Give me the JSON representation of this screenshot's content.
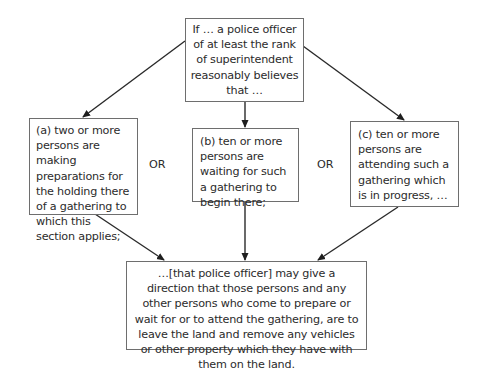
{
  "diagram": {
    "type": "flowchart",
    "condition": {
      "text": "If … a police officer of at least the rank of superintendent reasonably believes that …"
    },
    "options": [
      {
        "id": "a",
        "text": "(a) two or more persons are making preparations for the holding there of a gathering to which this section applies;"
      },
      {
        "id": "b",
        "text": "(b) ten or more persons are waiting for such a gathering to begin there;"
      },
      {
        "id": "c",
        "text": "(c) ten or more persons are attending such a gathering which is in progress, …"
      }
    ],
    "connectors": [
      {
        "label": "OR"
      },
      {
        "label": "OR"
      }
    ],
    "outcome": {
      "text": "…[that police officer] may give a direction that those persons and any other persons who come to prepare or wait for or to attend the gathering, are to leave the land and remove any vehicles or other property which they have with them on the land."
    },
    "edges": [
      {
        "from": "condition",
        "to": "a"
      },
      {
        "from": "condition",
        "to": "b"
      },
      {
        "from": "condition",
        "to": "c"
      },
      {
        "from": "a",
        "to": "outcome"
      },
      {
        "from": "b",
        "to": "outcome"
      },
      {
        "from": "c",
        "to": "outcome"
      }
    ],
    "colors": {
      "line": "#2a2a2a",
      "box_border": "#6e6e6e",
      "background": "#ffffff"
    }
  }
}
